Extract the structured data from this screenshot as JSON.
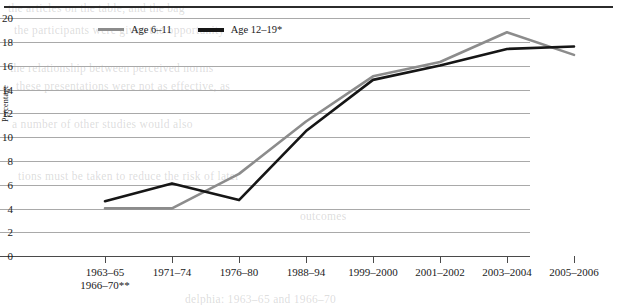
{
  "chart_data": {
    "type": "line",
    "title": "",
    "xlabel": "",
    "ylabel": "Percentage",
    "ylim": [
      0,
      20
    ],
    "ytick_step": 2,
    "yticks": [
      20,
      18,
      16,
      14,
      12,
      10,
      8,
      6,
      4,
      2,
      0
    ],
    "grid": true,
    "legend_position": "top-left-inside",
    "categories": [
      "1963–65\n1966–70**",
      "1971–74",
      "1976–80",
      "1988–94",
      "1999–2000",
      "2001–2002",
      "2003–2004",
      "2005–2006"
    ],
    "category_labels": [
      {
        "line1": "1963–65",
        "line2": "1966–70**"
      },
      {
        "line1": "1971–74",
        "line2": ""
      },
      {
        "line1": "1976–80",
        "line2": ""
      },
      {
        "line1": "1988–94",
        "line2": ""
      },
      {
        "line1": "1999–2000",
        "line2": ""
      },
      {
        "line1": "2001–2002",
        "line2": ""
      },
      {
        "line1": "2003–2004",
        "line2": ""
      },
      {
        "line1": "2005–2006",
        "line2": ""
      }
    ],
    "series": [
      {
        "name": "Age 6–11",
        "color": "#8c8c8c",
        "values": [
          4.0,
          4.0,
          6.9,
          11.3,
          15.1,
          16.3,
          18.8,
          16.9
        ]
      },
      {
        "name": "Age 12–19*",
        "color": "#161616",
        "values": [
          4.6,
          6.1,
          4.7,
          10.5,
          14.8,
          16.0,
          17.4,
          17.6
        ]
      }
    ]
  },
  "legend": {
    "items": [
      {
        "label": "Age 6–11",
        "color": "#8c8c8c"
      },
      {
        "label": "Age 12–19*",
        "color": "#161616"
      }
    ]
  },
  "axes": {
    "y_title": "Percentage",
    "y_labels": [
      "20",
      "18",
      "16",
      "14",
      "12",
      "10",
      "8",
      "6",
      "4",
      "2",
      "0"
    ]
  },
  "artifacts": {
    "bleed_lines": [
      "the articles on the table, and the bag",
      "the participants were given the opportunity",
      "the relationship between perceived norms",
      "these presentations were not as effective, as",
      "a number of other studies would also",
      "tions must be taken to reduce the risk of later",
      "outcomes"
    ],
    "bleed_footer": "delphia: 1963–65 and 1966–70"
  }
}
